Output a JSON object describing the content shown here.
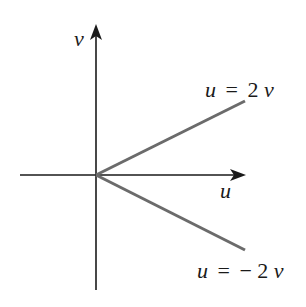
{
  "diagram": {
    "type": "coordinate-plane",
    "axes": {
      "horizontal": {
        "label": "u",
        "from": [
          20,
          175
        ],
        "to": [
          245,
          175
        ]
      },
      "vertical": {
        "label": "v",
        "from": [
          96,
          290
        ],
        "to": [
          96,
          25
        ]
      }
    },
    "origin": [
      96,
      175
    ],
    "rays": [
      {
        "name": "upper-ray",
        "equation": "u = 2v",
        "from": [
          96,
          175
        ],
        "to": [
          245,
          101
        ],
        "color": "#6b6b6b"
      },
      {
        "name": "lower-ray",
        "equation": "u = −2v",
        "from": [
          96,
          175
        ],
        "to": [
          245,
          250
        ],
        "color": "#6b6b6b"
      }
    ],
    "labels": {
      "v_axis": "v",
      "u_axis": "u",
      "upper_ray": {
        "lhs": "u",
        "eq": "=",
        "coef": "2",
        "var": "v"
      },
      "lower_ray": {
        "lhs": "u",
        "eq": "=",
        "neg": "−",
        "coef": "2",
        "var": "v"
      }
    }
  }
}
